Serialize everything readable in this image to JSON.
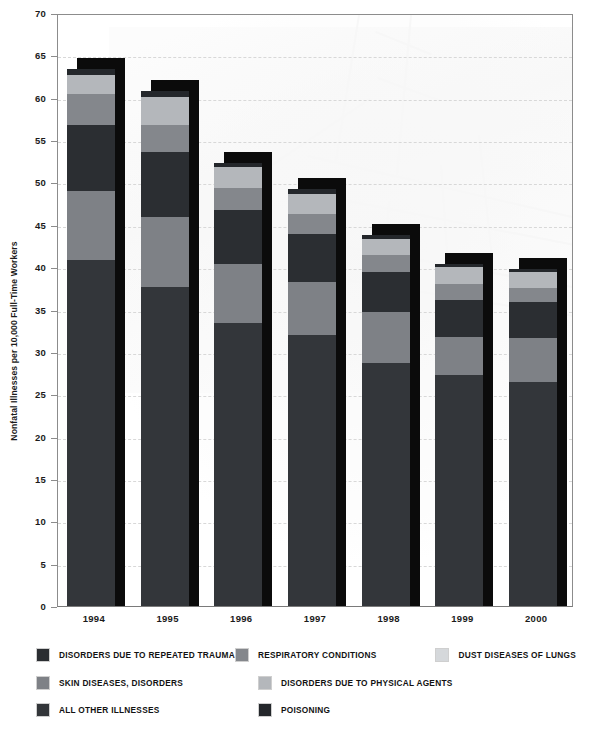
{
  "chart_data": {
    "type": "bar",
    "subtype": "stacked-bar",
    "title": "",
    "xlabel": "",
    "ylabel": "Nonfatal Illnesses per 10,000 Full-Time Workers",
    "ylim": [
      0,
      70
    ],
    "yticks": [
      0,
      5,
      10,
      15,
      20,
      25,
      30,
      35,
      40,
      45,
      50,
      55,
      60,
      65,
      70
    ],
    "ytick_labels": [
      "0",
      "5",
      "10",
      "15",
      "20",
      "25",
      "30",
      "35",
      "40",
      "45",
      "50",
      "55",
      "60",
      "65",
      "70"
    ],
    "grid": "horizontal-dashed",
    "legend_position": "below",
    "categories": [
      "1994",
      "1995",
      "1996",
      "1997",
      "1998",
      "1999",
      "2000"
    ],
    "series": [
      {
        "name": "ALL OTHER ILLNESSES",
        "color": "#33363a",
        "values": [
          40.8,
          37.6,
          33.4,
          32.0,
          28.7,
          27.3,
          26.4
        ]
      },
      {
        "name": "SKIN DISEASES, DISORDERS",
        "color": "#7e8186",
        "values": [
          8.2,
          8.3,
          7.0,
          6.2,
          6.0,
          4.5,
          5.2
        ]
      },
      {
        "name": "DISORDERS DUE TO REPEATED TRAUMA",
        "color": "#2b2e32",
        "values": [
          7.8,
          7.7,
          6.3,
          5.7,
          4.7,
          4.3,
          4.3
        ]
      },
      {
        "name": "RESPIRATORY CONDITIONS",
        "color": "#84878c",
        "values": [
          3.6,
          3.2,
          2.7,
          2.4,
          2.0,
          1.9,
          1.7
        ]
      },
      {
        "name": "DUST DISEASES OF LUNGS",
        "color": "#b4b7bb",
        "values": [
          2.3,
          3.3,
          2.4,
          2.3,
          1.9,
          2.0,
          1.8
        ]
      },
      {
        "name": "POISONING",
        "color": "#24272b",
        "values": [
          0.7,
          0.7,
          0.5,
          0.6,
          0.5,
          0.4,
          0.4
        ]
      }
    ],
    "totals": [
      63.4,
      60.8,
      52.3,
      49.2,
      43.8,
      40.4,
      39.8
    ]
  },
  "axis": {
    "y_title": "Nonfatal Illnesses per 10,000 Full-Time Workers"
  },
  "legend": {
    "rows": [
      [
        {
          "label": "DISORDERS DUE TO REPEATED TRAUMA",
          "color": "#2b2e32"
        },
        {
          "label": "RESPIRATORY CONDITIONS",
          "color": "#84878c"
        },
        {
          "label": "DUST DISEASES OF LUNGS",
          "color": "#d5d8db"
        }
      ],
      [
        {
          "label": "SKIN DISEASES, DISORDERS",
          "color": "#7e8186"
        },
        {
          "label": "DISORDERS DUE TO PHYSICAL AGENTS",
          "color": "#b4b7bb"
        }
      ],
      [
        {
          "label": "ALL OTHER ILLNESSES",
          "color": "#33363a"
        },
        {
          "label": "POISONING",
          "color": "#24272b"
        }
      ]
    ]
  },
  "colors": {
    "shadow": "#0b0b0b",
    "axis": "#8c8c8c",
    "grid": "#d8d8d8",
    "text": "#121212",
    "background": "#ffffff"
  }
}
